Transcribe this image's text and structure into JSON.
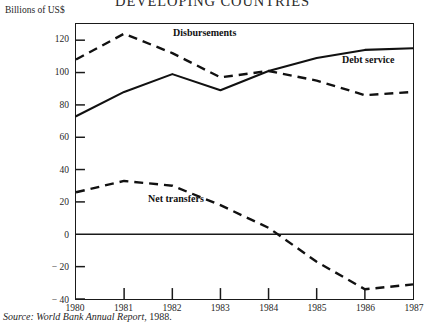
{
  "chart_data": {
    "type": "line",
    "title": "DEVELOPING COUNTRIES",
    "subtitle": "",
    "ylabel": "Billions of US$",
    "xlabel": "",
    "x": [
      1980,
      1981,
      1982,
      1983,
      1984,
      1985,
      1986,
      1987
    ],
    "xtick_labels": [
      "1980",
      "1981",
      "1982",
      "1983",
      "1984",
      "1985",
      "1986",
      "1987"
    ],
    "ytick_labels": [
      "120",
      "100",
      "80",
      "60",
      "40",
      "20",
      "0",
      "− 20",
      "− 40"
    ],
    "ytick_values": [
      120,
      100,
      80,
      60,
      40,
      20,
      0,
      -20,
      -40
    ],
    "ylim": [
      -40,
      130
    ],
    "xlim": [
      1980,
      1987
    ],
    "grid": false,
    "legend": "inline annotations",
    "zero_line": true,
    "series": [
      {
        "name": "Disbursements",
        "style": "dashed",
        "color": "#111111",
        "values": [
          108,
          124,
          112,
          97,
          101,
          95,
          86,
          88
        ],
        "label_position": "above curve between 1982 and 1983"
      },
      {
        "name": "Debt service",
        "style": "solid",
        "color": "#111111",
        "values": [
          73,
          88,
          99,
          89,
          101,
          109,
          114,
          115
        ],
        "label_position": "above curve near 1986"
      },
      {
        "name": "Net transfers",
        "style": "dashed",
        "color": "#111111",
        "values": [
          26,
          33,
          30,
          18,
          4,
          -17,
          -34,
          -31
        ],
        "label_position": "above curve near 1982"
      }
    ],
    "annotations": [
      "Disbursements",
      "Debt service",
      "Net transfers"
    ]
  },
  "figure": {
    "title": "DEVELOPING COUNTRIES",
    "unit_label": "Billions of US$",
    "source_prefix": "Source: World Bank Annual Report",
    "source_separator": ", ",
    "source_year": "1988.",
    "series_labels": {
      "disbursements": "Disbursements",
      "debt_service": "Debt service",
      "net_transfers": "Net transfers"
    },
    "axis": {
      "y_ticks": [
        "120",
        "100",
        "80",
        "60",
        "40",
        "20",
        "0",
        "− 20",
        "− 40"
      ],
      "x_ticks": [
        "1980",
        "1981",
        "1982",
        "1983",
        "1984",
        "1985",
        "1986",
        "1987"
      ]
    },
    "colors": {
      "ink": "#1a1a1a",
      "line": "#111111",
      "background": "#ffffff"
    }
  }
}
